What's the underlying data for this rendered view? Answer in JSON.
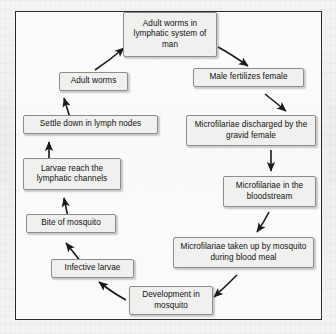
{
  "diagram": {
    "frame": {
      "border_color": "#2a2a2a",
      "background_color": "#fcfcfb"
    },
    "node_style": {
      "fill_color": "#f0f0ee",
      "border_color": "#8d8d8d",
      "text_color": "#111111"
    },
    "arrow_color": "#1a1a1a",
    "nodes": [
      {
        "id": "adult-worms-lymphatic-system",
        "label": "Adult worms in lymphatic system of man",
        "x": 122,
        "y": 11,
        "w": 94,
        "h": 45
      },
      {
        "id": "male-fertilizes-female",
        "label": "Male fertilizes female",
        "x": 192,
        "y": 67,
        "w": 111,
        "h": 19
      },
      {
        "id": "microfilariae-discharged",
        "label": "Microfilariae discharged by the gravid female",
        "x": 185,
        "y": 114,
        "w": 130,
        "h": 31
      },
      {
        "id": "microfilariae-bloodstream",
        "label": "Microfilariae in the bloodstream",
        "x": 222,
        "y": 175,
        "w": 93,
        "h": 31
      },
      {
        "id": "microfilariae-taken-up",
        "label": "Microfilariae taken up by mosquito during blood meal",
        "x": 172,
        "y": 236,
        "w": 141,
        "h": 31
      },
      {
        "id": "development-in-mosquito",
        "label": "Development in mosquito",
        "x": 128,
        "y": 285,
        "w": 84,
        "h": 29
      },
      {
        "id": "infective-larvae",
        "label": "Infective larvae",
        "x": 50,
        "y": 258,
        "w": 83,
        "h": 19
      },
      {
        "id": "bite-of-mosquito",
        "label": "Bite of mosquito",
        "x": 25,
        "y": 213,
        "w": 90,
        "h": 19
      },
      {
        "id": "larvae-reach-lymphatic-channels",
        "label": "Larvae reach the lymphatic channels",
        "x": 22,
        "y": 157,
        "w": 98,
        "h": 32
      },
      {
        "id": "settle-down-lymph-nodes",
        "label": "Settle down in lymph nodes",
        "x": 22,
        "y": 114,
        "w": 135,
        "h": 19
      },
      {
        "id": "adult-worms",
        "label": "Adult worms",
        "x": 58,
        "y": 71,
        "w": 69,
        "h": 19
      }
    ],
    "arrows": [
      {
        "id": "adult-worms-to-lymphatic-system",
        "from": "adult-worms",
        "to": "adult-worms-lymphatic-system",
        "direction": "up-right"
      },
      {
        "id": "lymphatic-system-to-male-fertilizes",
        "from": "adult-worms-lymphatic-system",
        "to": "male-fertilizes-female",
        "direction": "down-right"
      },
      {
        "id": "male-fertilizes-to-discharged",
        "from": "male-fertilizes-female",
        "to": "microfilariae-discharged",
        "direction": "down-right"
      },
      {
        "id": "discharged-to-bloodstream",
        "from": "microfilariae-discharged",
        "to": "microfilariae-bloodstream",
        "direction": "down"
      },
      {
        "id": "bloodstream-to-taken-up",
        "from": "microfilariae-bloodstream",
        "to": "microfilariae-taken-up",
        "direction": "down-left"
      },
      {
        "id": "taken-up-to-development",
        "from": "microfilariae-taken-up",
        "to": "development-in-mosquito",
        "direction": "down-left"
      },
      {
        "id": "development-to-infective-larvae",
        "from": "development-in-mosquito",
        "to": "infective-larvae",
        "direction": "up-left"
      },
      {
        "id": "infective-larvae-to-bite",
        "from": "infective-larvae",
        "to": "bite-of-mosquito",
        "direction": "up-left"
      },
      {
        "id": "bite-to-larvae-reach",
        "from": "bite-of-mosquito",
        "to": "larvae-reach-lymphatic-channels",
        "direction": "up"
      },
      {
        "id": "larvae-reach-to-settle-down",
        "from": "larvae-reach-lymphatic-channels",
        "to": "settle-down-lymph-nodes",
        "direction": "up"
      },
      {
        "id": "settle-down-to-adult-worms",
        "from": "settle-down-lymph-nodes",
        "to": "adult-worms",
        "direction": "up"
      }
    ]
  }
}
